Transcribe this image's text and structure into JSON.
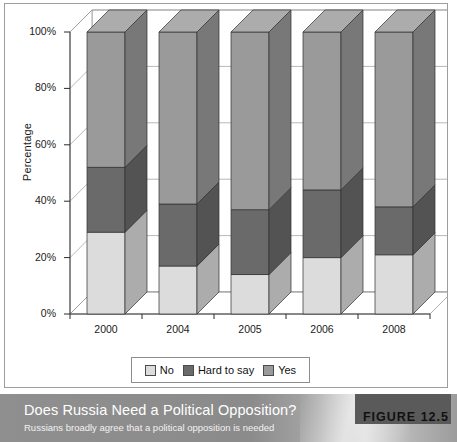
{
  "figure": {
    "badge_label": "FIGURE 12.5",
    "caption_title": "Does Russia Need a Political Opposition?",
    "caption_subtitle": "Russians broadly agree that a political opposition is needed"
  },
  "legend": {
    "items": [
      {
        "label": "No",
        "color": "#dcdcdc"
      },
      {
        "label": "Hard to say",
        "color": "#6a6a6a"
      },
      {
        "label": "Yes",
        "color": "#9a9a9a"
      }
    ]
  },
  "axis": {
    "y_title": "Percentage",
    "y_ticks": [
      "0%",
      "20%",
      "40%",
      "60%",
      "80%",
      "100%"
    ],
    "x_ticks": [
      "2000",
      "2004",
      "2005",
      "2006",
      "2008"
    ]
  },
  "chart_data": {
    "type": "bar",
    "title": "Does Russia Need a Political Opposition?",
    "subtitle": "Russians broadly agree that a political opposition is needed",
    "xlabel": "",
    "ylabel": "Percentage",
    "ylim": [
      0,
      100
    ],
    "yticks": [
      0,
      20,
      40,
      60,
      80,
      100
    ],
    "ytick_labels": [
      "0%",
      "20%",
      "40%",
      "60%",
      "80%",
      "100%"
    ],
    "stacked": true,
    "grid": true,
    "legend_position": "bottom",
    "three_d": true,
    "categories": [
      "2000",
      "2004",
      "2005",
      "2006",
      "2008"
    ],
    "series": [
      {
        "name": "No",
        "color": "#dcdcdc",
        "values": [
          29,
          17,
          14,
          20,
          21
        ]
      },
      {
        "name": "Hard to say",
        "color": "#6a6a6a",
        "values": [
          23,
          22,
          23,
          24,
          17
        ]
      },
      {
        "name": "Yes",
        "color": "#9a9a9a",
        "values": [
          48,
          61,
          63,
          56,
          62
        ]
      }
    ]
  }
}
